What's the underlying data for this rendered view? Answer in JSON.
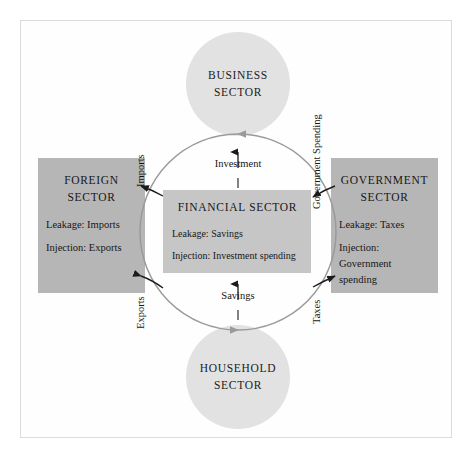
{
  "diagram": {
    "colors": {
      "circle_fill": "#e2e2e2",
      "box_fill": "#b6b6b6",
      "financial_fill": "#c6c6c6",
      "arrow": "#8a8a8a",
      "connector_arrow": "#1b1b1b",
      "frame": "#dcdcdc",
      "text": "#171717"
    }
  },
  "business": {
    "name": "BUSINESS SECTOR"
  },
  "household": {
    "line1": "HOUSEHOLD",
    "line2": "SECTOR"
  },
  "foreign": {
    "title_line1": "FOREIGN",
    "title_line2": "SECTOR",
    "leakage": "Leakage:  Imports",
    "injection": "Injection:  Exports"
  },
  "government": {
    "title_line1": "GOVERNMENT",
    "title_line2": "SECTOR",
    "leakage": "Leakage:  Taxes",
    "injection_line1": "Injection:",
    "injection_line2": "Government",
    "injection_line3": "spending"
  },
  "financial": {
    "title": "FINANCIAL SECTOR",
    "leakage": "Leakage:  Savings",
    "injection": "Injection:  Investment spending"
  },
  "flows": {
    "investment": "Investment",
    "savings": "Savings",
    "imports": "Imports",
    "exports": "Exports",
    "government_spending": "Government Spending",
    "taxes": "Taxes"
  }
}
